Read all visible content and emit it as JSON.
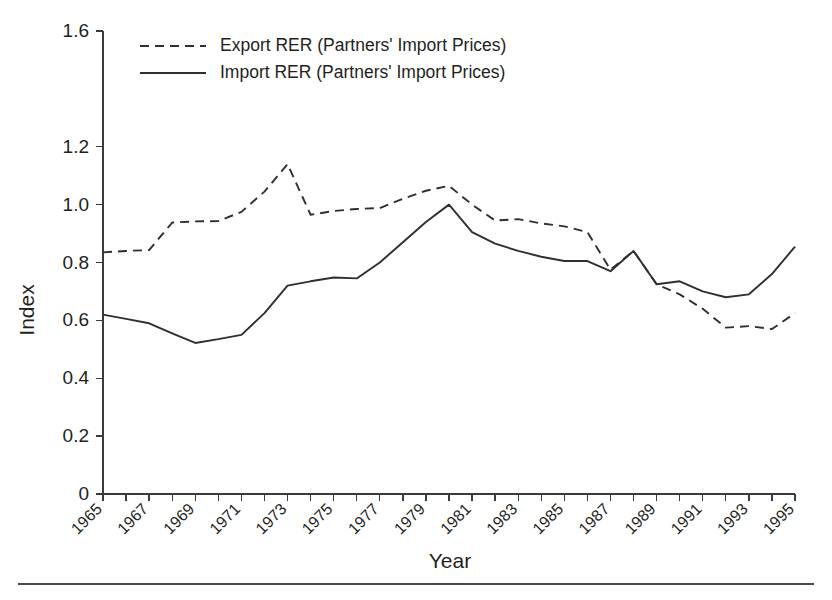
{
  "figure": {
    "background_color": "#ffffff",
    "line_color": "#2f2f2f",
    "axis_color": "#3b3b3b",
    "footer_rule": true
  },
  "chart_data": {
    "type": "line",
    "title": "",
    "xlabel": "Year",
    "ylabel": "Index",
    "xlim": [
      1965,
      1995
    ],
    "ylim": [
      0,
      1.6
    ],
    "grid": false,
    "legend_position": "top-left-inside",
    "y_ticks": [
      0,
      0.2,
      0.4,
      0.6,
      0.8,
      1.0,
      1.2,
      1.6
    ],
    "y_tick_labels": [
      "0",
      "0.2",
      "0.4",
      "0.6",
      "0.8",
      "1.0",
      "1.2",
      "1.6"
    ],
    "x_ticks": [
      1965,
      1966,
      1967,
      1968,
      1969,
      1970,
      1971,
      1972,
      1973,
      1974,
      1975,
      1976,
      1977,
      1978,
      1979,
      1980,
      1981,
      1982,
      1983,
      1984,
      1985,
      1986,
      1987,
      1988,
      1989,
      1990,
      1991,
      1992,
      1993,
      1994,
      1995
    ],
    "x_tick_labels": [
      "1965",
      "1967",
      "1969",
      "1971",
      "1973",
      "1975",
      "1977",
      "1979",
      "1981",
      "1983",
      "1985",
      "1987",
      "1989",
      "1991",
      "1993",
      "1995"
    ],
    "x_tick_label_years": [
      1965,
      1967,
      1969,
      1971,
      1973,
      1975,
      1977,
      1979,
      1981,
      1983,
      1985,
      1987,
      1989,
      1991,
      1993,
      1995
    ],
    "x": [
      1965,
      1966,
      1967,
      1968,
      1969,
      1970,
      1971,
      1972,
      1973,
      1974,
      1975,
      1976,
      1977,
      1978,
      1979,
      1980,
      1981,
      1982,
      1983,
      1984,
      1985,
      1986,
      1987,
      1988,
      1989,
      1990,
      1991,
      1992,
      1993,
      1994,
      1995
    ],
    "series": [
      {
        "name": "Export RER (Partners' Import Prices)",
        "style": "dashed",
        "values": [
          0.835,
          0.84,
          0.843,
          0.938,
          0.942,
          0.943,
          0.975,
          1.045,
          1.14,
          0.965,
          0.978,
          0.985,
          0.988,
          1.02,
          1.048,
          1.065,
          1.0,
          0.945,
          0.95,
          0.935,
          0.925,
          0.905,
          0.775,
          0.84,
          0.725,
          0.69,
          0.64,
          0.575,
          0.58,
          0.57,
          0.625
        ]
      },
      {
        "name": "Import RER (Partners' Import Prices)",
        "style": "solid",
        "values": [
          0.62,
          0.605,
          0.59,
          0.555,
          0.522,
          0.535,
          0.55,
          0.625,
          0.72,
          0.735,
          0.748,
          0.745,
          0.8,
          0.87,
          0.94,
          1.0,
          0.905,
          0.865,
          0.84,
          0.82,
          0.805,
          0.805,
          0.77,
          0.84,
          0.725,
          0.735,
          0.7,
          0.68,
          0.69,
          0.76,
          0.855
        ]
      }
    ]
  },
  "legend": {
    "items": [
      {
        "label": "Export RER (Partners' Import Prices)",
        "style": "dashed"
      },
      {
        "label": "Import RER (Partners' Import Prices)",
        "style": "solid"
      }
    ]
  },
  "axes": {
    "y_title": "Index",
    "x_title": "Year"
  }
}
